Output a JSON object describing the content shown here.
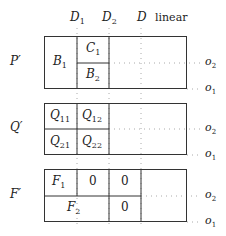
{
  "columns": {
    "d1": {
      "label": "D",
      "sub": "1"
    },
    "d2": {
      "label": "D",
      "sub": "2"
    },
    "d": {
      "label": "D"
    },
    "linear": "linear"
  },
  "rows": {
    "o2": {
      "label": "o",
      "sub": "2"
    },
    "o1": {
      "label": "o",
      "sub": "1"
    }
  },
  "blocks": [
    {
      "label": "P′",
      "cells": {
        "b1": {
          "label": "B",
          "sub": "1"
        },
        "c1": {
          "label": "C",
          "sub": "1"
        },
        "b2": {
          "label": "B",
          "sub": "2"
        }
      }
    },
    {
      "label": "Q′",
      "cells": {
        "q11": {
          "label": "Q",
          "sub": "11"
        },
        "q12": {
          "label": "Q",
          "sub": "12"
        },
        "q21": {
          "label": "Q",
          "sub": "21"
        },
        "q22": {
          "label": "Q",
          "sub": "22"
        }
      }
    },
    {
      "label": "F′",
      "cells": {
        "f1": {
          "label": "F",
          "sub": "1"
        },
        "z1": "0",
        "z2": "0",
        "f2": {
          "label": "F",
          "sub": "2"
        },
        "z3": "0"
      }
    }
  ],
  "colors": {
    "line": "#333333",
    "dotted": "#aaaaaa"
  }
}
